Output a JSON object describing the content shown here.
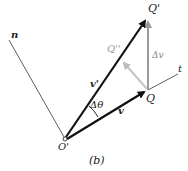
{
  "figure": {
    "caption": "(b)",
    "labels": {
      "n_axis": "n",
      "t_axis": "t",
      "origin": "O'",
      "point_q": "Q",
      "point_q_prime": "Q'",
      "point_q_double_prime": "Q''",
      "vector_v": "v",
      "vector_v_prime": "v'",
      "delta_v": "Δv",
      "delta_theta": "Δθ"
    },
    "colors": {
      "primary_vector": "#111111",
      "secondary_vector": "#bbbbbb",
      "delta_v_vector": "#999999",
      "axis_line": "#333333",
      "label_gray": "#888888"
    }
  }
}
